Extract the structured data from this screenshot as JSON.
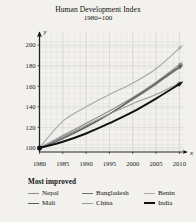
{
  "chart_data": {
    "type": "line",
    "title": "Human Development Index",
    "subtitle": "1980=100",
    "xlabel": "x",
    "ylabel": "y",
    "xlim": [
      1980,
      2011
    ],
    "ylim": [
      96,
      205
    ],
    "xticks": [
      1980,
      1985,
      1990,
      1995,
      2000,
      2005,
      2010
    ],
    "yticks": [
      100,
      120,
      140,
      160,
      180,
      200
    ],
    "grid": true,
    "legend_position": "below",
    "legend_title": "Most improved",
    "x": [
      1980,
      1985,
      1990,
      1995,
      2000,
      2005,
      2010
    ],
    "series": [
      {
        "name": "Nepal",
        "color": "#8c8c8c",
        "width": 1.1,
        "values": [
          100,
          112,
          124,
          136,
          149,
          164,
          181
        ]
      },
      {
        "name": "Bangladesh",
        "color": "#707070",
        "width": 1.1,
        "values": [
          100,
          110,
          121,
          133,
          147,
          162,
          178
        ]
      },
      {
        "name": "Benin",
        "color": "#a8a8a8",
        "width": 1.1,
        "values": [
          100,
          126,
          140,
          152,
          163,
          177,
          197
        ]
      },
      {
        "name": "Mali",
        "color": "#5a5a5a",
        "width": 1.1,
        "values": [
          100,
          109,
          120,
          133,
          148,
          163,
          179
        ]
      },
      {
        "name": "China",
        "color": "#9a9a9a",
        "width": 1.1,
        "values": [
          100,
          111,
          122,
          133,
          143,
          152,
          163
        ]
      },
      {
        "name": "India",
        "color": "#111111",
        "width": 1.9,
        "values": [
          100,
          106,
          114,
          124,
          135,
          148,
          162
        ]
      }
    ]
  },
  "legend": {
    "title": "Most improved",
    "items": [
      {
        "label": "Nepal"
      },
      {
        "label": "Bangladesh"
      },
      {
        "label": "Benin"
      },
      {
        "label": "Mali"
      },
      {
        "label": "China"
      },
      {
        "label": "India"
      }
    ]
  },
  "axes": {
    "y_letter": "y",
    "x_letter": "x"
  }
}
